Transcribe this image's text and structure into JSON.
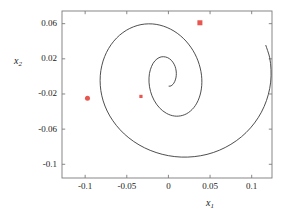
{
  "chart_data": {
    "type": "line",
    "title": "",
    "xlabel": "x_1",
    "ylabel": "x_2",
    "xlabel_base": "x",
    "xlabel_sub": "1",
    "ylabel_base": "x",
    "ylabel_sub": "2",
    "xlim": [
      -0.1278,
      0.1244
    ],
    "ylim": [
      -0.1156,
      0.0744
    ],
    "grid": false,
    "legend": false,
    "legend_position": "none",
    "xticks": [
      -0.1,
      -0.05,
      0,
      0.05,
      0.1
    ],
    "xticklabels": [
      "-0.1",
      "-0.05",
      "0",
      "0.05",
      "0.1"
    ],
    "yticks": [
      0.06,
      0.02,
      -0.02,
      -0.06,
      -0.1
    ],
    "yticklabels": [
      "0.06",
      "0.02",
      "-0.02",
      "-0.06",
      "-0.1"
    ],
    "line_color": "#3a3a3a",
    "line_width": 0.9,
    "marker_color": "#e8564f",
    "series": [
      {
        "name": "spiral-trajectory",
        "description": "inward logarithmic spiral trajectory",
        "x": [
          0.117,
          0.1215,
          0.1232,
          0.1228,
          0.12,
          0.115,
          0.1078,
          0.0986,
          0.0876,
          0.075,
          0.0612,
          0.0464,
          0.031,
          0.0154,
          0.0,
          -0.0148,
          -0.0288,
          -0.0416,
          -0.053,
          -0.0626,
          -0.0704,
          -0.0762,
          -0.08,
          -0.0818,
          -0.0818,
          -0.08,
          -0.0766,
          -0.0718,
          -0.0657,
          -0.0586,
          -0.0506,
          -0.042,
          -0.033,
          -0.0238,
          -0.0147,
          -0.0058,
          0.0027,
          0.0106,
          0.0178,
          0.0241,
          0.0295,
          0.0338,
          0.037,
          0.0391,
          0.0401,
          0.04,
          0.0389,
          0.0369,
          0.0341,
          0.0306,
          0.0265,
          0.022,
          0.0172,
          0.0122,
          0.0072,
          0.0023,
          -0.0024,
          -0.0068,
          -0.0108,
          -0.0143,
          -0.0173,
          -0.0197,
          -0.0215,
          -0.0227,
          -0.0233,
          -0.0233,
          -0.0228,
          -0.0217,
          -0.0202,
          -0.0184,
          -0.0162,
          -0.0138,
          -0.0113,
          -0.0087,
          -0.006,
          -0.0034,
          -0.0009,
          0.0014,
          0.0035,
          0.0053,
          0.0068,
          0.008,
          0.0088,
          0.0093,
          0.0095,
          0.0094,
          0.009,
          0.0083,
          0.0075,
          0.0065,
          0.0054,
          0.0042,
          0.0031,
          0.0019,
          0.0008
        ],
        "y": [
          0.0352,
          0.0218,
          0.0078,
          -0.0065,
          -0.0206,
          -0.0342,
          -0.047,
          -0.0586,
          -0.0688,
          -0.0773,
          -0.084,
          -0.0887,
          -0.0913,
          -0.0918,
          -0.0902,
          -0.0866,
          -0.0812,
          -0.0741,
          -0.0655,
          -0.0557,
          -0.045,
          -0.0337,
          -0.022,
          -0.0103,
          0.0012,
          0.0122,
          0.0225,
          0.0318,
          0.04,
          0.0469,
          0.0524,
          0.0564,
          0.0589,
          0.0598,
          0.0592,
          0.0571,
          0.0537,
          0.0491,
          0.0434,
          0.0368,
          0.0295,
          0.0217,
          0.0136,
          0.0054,
          -0.0027,
          -0.0105,
          -0.0178,
          -0.0245,
          -0.0304,
          -0.0354,
          -0.0394,
          -0.0424,
          -0.0443,
          -0.0452,
          -0.0451,
          -0.044,
          -0.042,
          -0.0392,
          -0.0357,
          -0.0316,
          -0.027,
          -0.0221,
          -0.017,
          -0.0118,
          -0.0066,
          -0.0016,
          0.0032,
          0.0076,
          0.0115,
          0.0149,
          0.0177,
          0.0198,
          0.0213,
          0.0222,
          0.0224,
          0.0221,
          0.0213,
          0.02,
          0.0183,
          0.0162,
          0.0139,
          0.0114,
          0.0088,
          0.0061,
          0.0034,
          0.0008,
          -0.0017,
          -0.004,
          -0.006,
          -0.0077,
          -0.0091,
          -0.0101,
          -0.0108,
          -0.0111,
          -0.0111
        ]
      }
    ],
    "markers": [
      {
        "name": "marker-upper-right",
        "shape": "square",
        "x": 0.0378,
        "y": 0.061,
        "size": 5.0
      },
      {
        "name": "marker-left",
        "shape": "circle",
        "x": -0.0972,
        "y": -0.0248,
        "size": 5.0
      },
      {
        "name": "marker-inner",
        "shape": "square",
        "x": -0.033,
        "y": -0.0228,
        "size": 3.2
      }
    ]
  },
  "axes": {
    "frame_color": "#7a7a7a",
    "background": "#ffffff"
  }
}
